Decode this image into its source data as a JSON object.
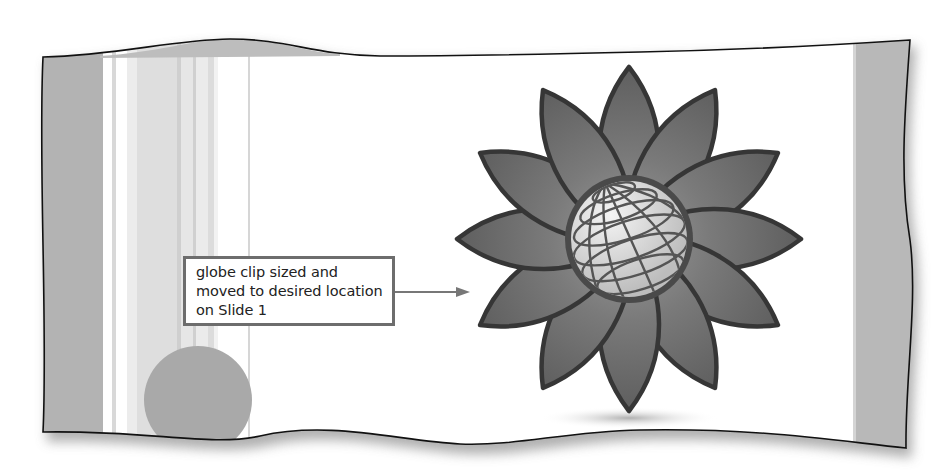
{
  "figure": {
    "callout": {
      "lines": [
        "globe clip sized and",
        "moved to desired location",
        "on Slide 1"
      ]
    },
    "clip_art": {
      "name": "globe-flower",
      "petal_count": 12
    }
  },
  "colors": {
    "frame_band": "#b5b5b5",
    "petal": "#6a6a6a",
    "petal_outline": "#333333",
    "globe": "#dcdcdc",
    "decor_circle": "#a9a9a9",
    "callout_border": "#6d6d6d"
  }
}
